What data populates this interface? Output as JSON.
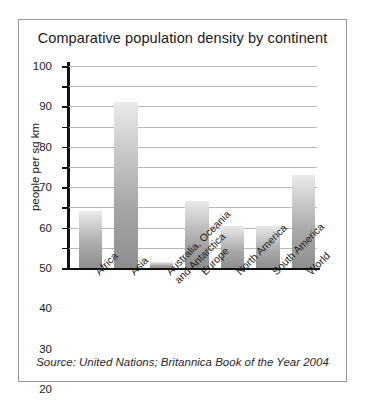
{
  "figure": {
    "title": "Comparative population density by continent",
    "source_note": "Source: United Nations; Britannica Book of the Year 2004",
    "border_color": "#9a9a9a",
    "background": "#ffffff"
  },
  "chart_data": {
    "type": "bar",
    "title": "Comparative population density by continent",
    "xlabel": "",
    "ylabel": "people per sq km",
    "ylim": [
      0,
      100
    ],
    "ytick_step": 10,
    "yticks": [
      100,
      90,
      80,
      70,
      60,
      50,
      40,
      30,
      20,
      10,
      0
    ],
    "ytick_labels": [
      "100",
      "90",
      "80",
      "70",
      "60",
      "50",
      "40",
      "30",
      "20",
      "10",
      "0"
    ],
    "grid": true,
    "legend": "none",
    "bar_color_top": "#eaeaea",
    "bar_color_bottom": "#8e8e8e",
    "categories": [
      "Africa",
      "Asia",
      "Australia, Oceania and Antarctica",
      "Europe",
      "North America",
      "South America",
      "World"
    ],
    "category_labels_display": [
      "Africa",
      "Asia",
      "Australia, Oceania and Antarctica",
      "Europe",
      "North America",
      "South America",
      "World"
    ],
    "values": [
      28,
      82,
      3,
      33,
      21,
      21,
      46
    ],
    "units": "people per sq km"
  }
}
